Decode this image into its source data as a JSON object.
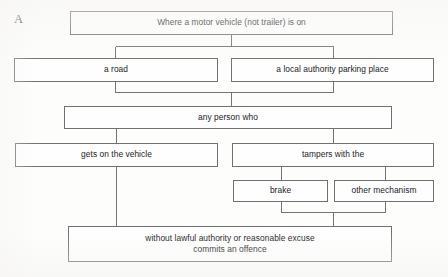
{
  "page": {
    "section_label": "A",
    "width": 448,
    "height": 277,
    "background_color": "#fdfdfc",
    "box_border_color": "#71716f",
    "connector_color": "#75756f",
    "text_color": "#1c1c1c"
  },
  "diagram": {
    "type": "flowchart",
    "orientation": "top-to-bottom",
    "title": "",
    "nodes": [
      {
        "id": "premise",
        "label": "Where a motor vehicle (not trailer) is on",
        "row": 1,
        "x": 70,
        "y": 11,
        "w": 323,
        "h": 24
      },
      {
        "id": "road",
        "label": "a road",
        "row": 2,
        "x": 14,
        "y": 58,
        "w": 204,
        "h": 24
      },
      {
        "id": "parking-place",
        "label": "a local authority parking place",
        "row": 2,
        "x": 231,
        "y": 58,
        "w": 203,
        "h": 24
      },
      {
        "id": "any-person",
        "label": "any person who",
        "row": 3,
        "x": 64,
        "y": 106,
        "w": 328,
        "h": 23
      },
      {
        "id": "gets-on",
        "label": "gets on the vehicle",
        "row": 4,
        "x": 15,
        "y": 143,
        "w": 203,
        "h": 24
      },
      {
        "id": "tampers",
        "label": "tampers with the",
        "row": 4,
        "x": 232,
        "y": 143,
        "w": 202,
        "h": 24
      },
      {
        "id": "brake",
        "label": "brake",
        "row": 5,
        "x": 233,
        "y": 180,
        "w": 95,
        "h": 22
      },
      {
        "id": "other-mechanism",
        "label": "other mechanism",
        "row": 5,
        "x": 334,
        "y": 180,
        "w": 100,
        "h": 22
      },
      {
        "id": "offence",
        "label": "without lawful authority or reasonable excuse\ncommits an offence",
        "row": 6,
        "x": 68,
        "y": 226,
        "w": 324,
        "h": 36
      }
    ],
    "edges": [
      {
        "from": "premise",
        "to": "road",
        "style": "orthogonal-split"
      },
      {
        "from": "premise",
        "to": "parking-place",
        "style": "orthogonal-split"
      },
      {
        "from": "road",
        "to": "any-person",
        "style": "orthogonal-merge"
      },
      {
        "from": "parking-place",
        "to": "any-person",
        "style": "orthogonal-merge"
      },
      {
        "from": "any-person",
        "to": "gets-on",
        "style": "orthogonal-split"
      },
      {
        "from": "any-person",
        "to": "tampers",
        "style": "orthogonal-split"
      },
      {
        "from": "tampers",
        "to": "brake",
        "style": "orthogonal-split"
      },
      {
        "from": "tampers",
        "to": "other-mechanism",
        "style": "orthogonal-split"
      },
      {
        "from": "brake",
        "to": "offence",
        "style": "orthogonal-merge"
      },
      {
        "from": "other-mechanism",
        "to": "offence",
        "style": "orthogonal-merge"
      },
      {
        "from": "gets-on",
        "to": "offence",
        "style": "straight"
      }
    ]
  }
}
